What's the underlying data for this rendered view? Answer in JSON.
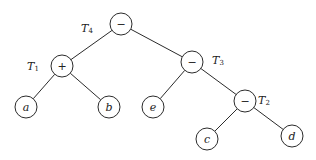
{
  "diagram": {
    "type": "expression-tree",
    "node_radius": 11,
    "colors": {
      "stroke": "#2b2b2b",
      "text": "#222222",
      "background": "#ffffff"
    },
    "nodes": [
      {
        "id": "root",
        "label": "−",
        "kind": "operator",
        "x": 121,
        "y": 24
      },
      {
        "id": "plus",
        "label": "+",
        "kind": "operator",
        "x": 62,
        "y": 66
      },
      {
        "id": "minus3",
        "label": "−",
        "kind": "operator",
        "x": 192,
        "y": 62
      },
      {
        "id": "a",
        "label": "a",
        "kind": "operand",
        "x": 26,
        "y": 107
      },
      {
        "id": "b",
        "label": "b",
        "kind": "operand",
        "x": 109,
        "y": 107
      },
      {
        "id": "e",
        "label": "e",
        "kind": "operand",
        "x": 153,
        "y": 107
      },
      {
        "id": "minus2",
        "label": "−",
        "kind": "operator",
        "x": 245,
        "y": 101
      },
      {
        "id": "c",
        "label": "c",
        "kind": "operand",
        "x": 207,
        "y": 139
      },
      {
        "id": "d",
        "label": "d",
        "kind": "operand",
        "x": 292,
        "y": 136
      }
    ],
    "edges": [
      {
        "from": "root",
        "to": "plus"
      },
      {
        "from": "root",
        "to": "minus3"
      },
      {
        "from": "plus",
        "to": "a"
      },
      {
        "from": "plus",
        "to": "b"
      },
      {
        "from": "minus3",
        "to": "e"
      },
      {
        "from": "minus3",
        "to": "minus2"
      },
      {
        "from": "minus2",
        "to": "c"
      },
      {
        "from": "minus2",
        "to": "d"
      }
    ],
    "subtree_labels": [
      {
        "id": "T4",
        "text": "T",
        "sub": "4",
        "x": 87,
        "y": 28
      },
      {
        "id": "T1",
        "text": "T",
        "sub": "1",
        "x": 33,
        "y": 66
      },
      {
        "id": "T3",
        "text": "T",
        "sub": "3",
        "x": 218,
        "y": 60
      },
      {
        "id": "T2",
        "text": "T",
        "sub": "2",
        "x": 264,
        "y": 100
      }
    ]
  }
}
